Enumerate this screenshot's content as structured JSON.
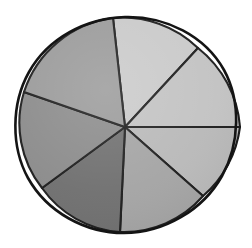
{
  "figure": {
    "background_color": "#ffffff",
    "outline_color": "#141414",
    "divider_color": "#1a1a1a",
    "shape": "circle"
  },
  "chart_data": {
    "type": "pie",
    "title": "",
    "xlabel": "",
    "ylabel": "",
    "legend": "none",
    "grid": false,
    "center_x": 125,
    "center_y": 127,
    "radius": 110,
    "labels_visible": false,
    "categories": [
      "Slice 1",
      "Slice 2",
      "Slice 3",
      "Slice 4",
      "Slice 5",
      "Slice 6",
      "Slice 7"
    ],
    "values": [
      16.1,
      13.9,
      12.8,
      14.7,
      15.8,
      14.2,
      12.5
    ],
    "start_angles_deg": [
      265.2,
      308.9,
      359.0,
      31.0,
      75.5,
      128.0,
      180.3
    ],
    "end_angles_deg": [
      308.9,
      359.0,
      31.0,
      75.5,
      128.0,
      180.3,
      265.2
    ],
    "colors": [
      "#c9c9c9",
      "#c2c2c2",
      "#b8b8b8",
      "#a3a3a3",
      "#6e6e6e",
      "#8a8a8a",
      "#999999"
    ],
    "rim_points": [
      [
        113,
        18
      ],
      [
        198,
        48
      ],
      [
        240,
        127
      ],
      [
        203,
        196
      ],
      [
        120,
        232
      ],
      [
        42,
        188
      ],
      [
        24,
        92
      ]
    ]
  }
}
